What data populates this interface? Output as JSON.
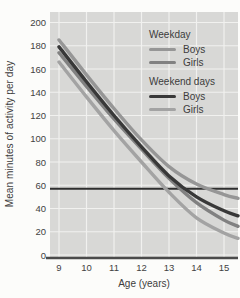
{
  "figure": {
    "y_axis_label": "Mean minutes of activity per day",
    "x_axis_label": "Age (years)",
    "y_ticks": [
      "200",
      "180",
      "160",
      "140",
      "120",
      "100",
      "80",
      "60",
      "40",
      "20",
      "0"
    ],
    "x_ticks": [
      "9",
      "10",
      "11",
      "12",
      "13",
      "14",
      "15"
    ]
  },
  "legend": {
    "groups": [
      {
        "header": "Weekday",
        "items": [
          {
            "label": "Boys",
            "color": "#969696"
          },
          {
            "label": "Girls",
            "color": "#818181"
          }
        ]
      },
      {
        "header": "Weekend days",
        "items": [
          {
            "label": "Boys",
            "color": "#383838"
          },
          {
            "label": "Girls",
            "color": "#a3a3a3"
          }
        ]
      }
    ]
  },
  "chart_data": {
    "type": "line",
    "title": "",
    "xlabel": "Age (years)",
    "ylabel": "Mean minutes of activity per day",
    "x": [
      9,
      10,
      11,
      12,
      13,
      14,
      15
    ],
    "ylim": [
      0,
      200
    ],
    "y_tick_step": 20,
    "grid": true,
    "legend_position": "upper-right-inside",
    "series": [
      {
        "name": "Weekday Boys",
        "color": "#969696",
        "values": [
          185,
          155,
          126,
          99,
          76,
          61,
          52
        ]
      },
      {
        "name": "Weekday Girls",
        "color": "#818181",
        "values": [
          174,
          145,
          117,
          91,
          66,
          45,
          30
        ]
      },
      {
        "name": "Weekend days Boys",
        "color": "#383838",
        "values": [
          179,
          149,
          120,
          93,
          68,
          50,
          38
        ]
      },
      {
        "name": "Weekend days Girls",
        "color": "#a3a3a3",
        "values": [
          166,
          136,
          107,
          80,
          54,
          32,
          19
        ]
      }
    ],
    "reference_line": {
      "value": 57,
      "color": "#2f2f2f"
    }
  },
  "colors": {
    "page_bg": "#fcfcfa",
    "plot_bg": "#d8d8d6",
    "grid": "#f1f1ef",
    "axis": "#4b4b4b",
    "text": "#3c3c3c"
  }
}
